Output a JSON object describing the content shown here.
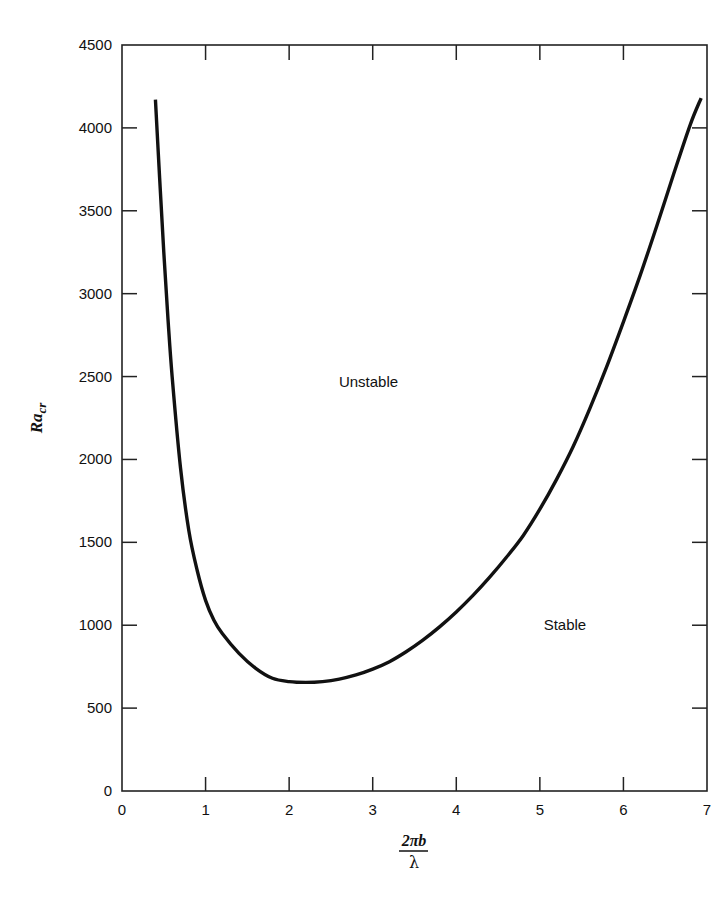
{
  "chart_data": {
    "type": "line",
    "title": "",
    "xlabel": "2πb / λ",
    "xlabel_numerator": "2πb",
    "xlabel_denominator": "λ",
    "ylabel": "Ra_cr",
    "ylabel_main": "Ra",
    "ylabel_sub": "cr",
    "xlim": [
      0,
      7
    ],
    "ylim": [
      0,
      4500
    ],
    "xticks": [
      0,
      1,
      2,
      3,
      4,
      5,
      6,
      7
    ],
    "yticks": [
      0,
      500,
      1000,
      1500,
      2000,
      2500,
      3000,
      3500,
      4000,
      4500
    ],
    "grid": false,
    "legend": null,
    "annotations": [
      {
        "text": "Unstable",
        "x": 2.95,
        "y": 2470
      },
      {
        "text": "Stable",
        "x": 5.3,
        "y": 1000
      }
    ],
    "series": [
      {
        "name": "Critical Rayleigh number",
        "color": "#111111",
        "x": [
          0.4,
          0.45,
          0.5,
          0.55,
          0.6,
          0.7,
          0.8,
          0.9,
          1.0,
          1.1,
          1.2,
          1.4,
          1.6,
          1.8,
          2.0,
          2.2,
          2.4,
          2.6,
          2.8,
          3.0,
          3.2,
          3.4,
          3.6,
          3.8,
          4.0,
          4.2,
          4.4,
          4.6,
          4.8,
          5.0,
          5.2,
          5.4,
          5.6,
          5.8,
          6.0,
          6.2,
          6.4,
          6.6,
          6.8,
          6.93
        ],
        "y": [
          4170,
          3700,
          3250,
          2850,
          2500,
          1950,
          1570,
          1330,
          1150,
          1030,
          950,
          830,
          740,
          680,
          660,
          655,
          660,
          675,
          700,
          735,
          780,
          840,
          910,
          990,
          1080,
          1180,
          1290,
          1410,
          1540,
          1700,
          1880,
          2080,
          2310,
          2560,
          2830,
          3110,
          3410,
          3720,
          4020,
          4180
        ]
      }
    ]
  }
}
